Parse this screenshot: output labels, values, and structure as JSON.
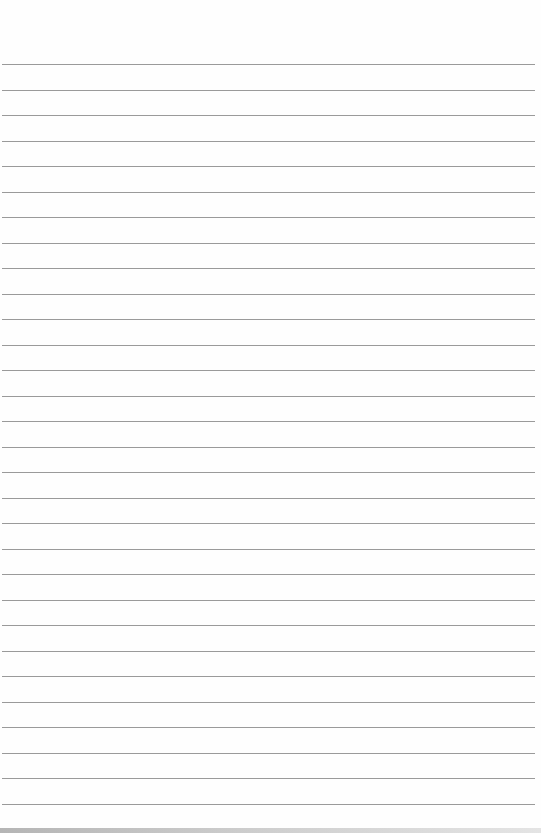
{
  "page": {
    "type": "lined-paper",
    "line_count": 30,
    "first_line_y": 64,
    "line_spacing": 25.5,
    "line_color": "#9a9a9a",
    "background_color": "#fefefe",
    "text_lines": []
  }
}
